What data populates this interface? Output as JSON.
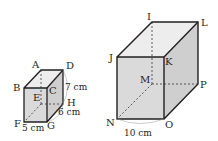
{
  "small_prism": {
    "vertices": {
      "A": "A",
      "B": "B",
      "C": "C",
      "D": "D",
      "E": "E",
      "F": "F",
      "G": "G",
      "H": "H"
    },
    "dimensions": {
      "width": "5 cm",
      "depth": "6 cm",
      "height": "7 cm"
    }
  },
  "large_prism": {
    "vertices": {
      "I": "I",
      "J": "J",
      "K": "K",
      "L": "L",
      "M": "M",
      "N": "N",
      "O": "O",
      "P": "P"
    },
    "dimensions": {
      "width": "10 cm"
    }
  },
  "colors": {
    "face": "#dcdcdc",
    "side": "#c8c8c8",
    "top": "#ececec",
    "edge": "#231f20"
  }
}
